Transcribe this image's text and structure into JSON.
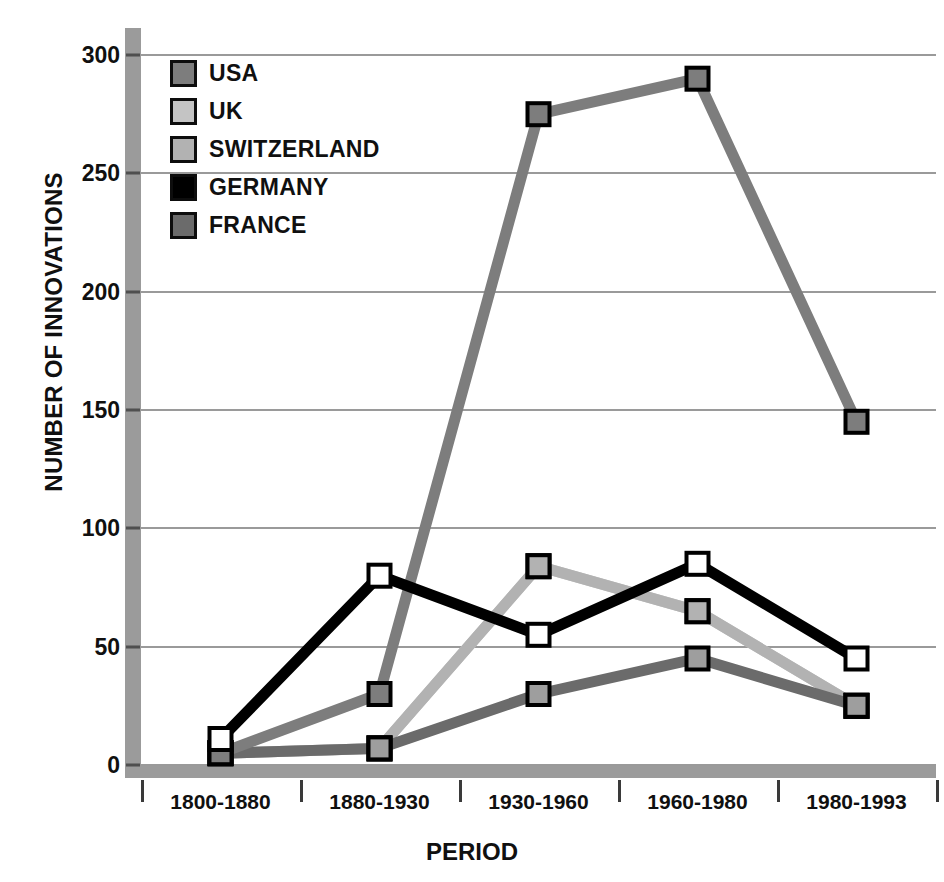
{
  "chart_data": {
    "type": "line",
    "title": "",
    "xlabel": "PERIOD",
    "ylabel": "NUMBER OF INNOVATIONS",
    "categories": [
      "1800-1880",
      "1880-1930",
      "1930-1960",
      "1960-1980",
      "1980-1993"
    ],
    "yticks": [
      0,
      50,
      100,
      150,
      200,
      250,
      300
    ],
    "ylim": [
      0,
      300
    ],
    "grid": true,
    "legend_position": "top-left inside plot",
    "series": [
      {
        "name": "USA",
        "color": "#7d7d7d",
        "marker_fill": "#7d7d7d",
        "values": [
          5,
          30,
          275,
          290,
          145
        ]
      },
      {
        "name": "UK",
        "color": "#c4c4c4",
        "marker_fill": "#c4c4c4",
        "values": [
          5,
          7,
          84,
          65,
          25
        ]
      },
      {
        "name": "SWITZERLAND",
        "color": "#b2b2b2",
        "marker_fill": "#b2b2b2",
        "values": [
          5,
          7,
          84,
          65,
          25
        ]
      },
      {
        "name": "GERMANY",
        "color": "#000000",
        "marker_fill": "#ffffff",
        "values": [
          11,
          80,
          55,
          85,
          45
        ]
      },
      {
        "name": "FRANCE",
        "color": "#6b6b6b",
        "marker_fill": "#9e9e9e",
        "values": [
          5,
          7,
          30,
          45,
          25
        ]
      }
    ]
  },
  "axes": {
    "y_title": "NUMBER OF INNOVATIONS",
    "x_title": "PERIOD",
    "y_tick_labels": [
      "300",
      "250",
      "200",
      "150",
      "100",
      "50",
      "0"
    ],
    "x_tick_labels": [
      "1800-1880",
      "1880-1930",
      "1930-1960",
      "1960-1980",
      "1980-1993"
    ]
  },
  "legend": {
    "items": [
      {
        "label": "USA",
        "swatch_color": "#7d7d7d"
      },
      {
        "label": "UK",
        "swatch_color": "#c4c4c4"
      },
      {
        "label": "SWITZERLAND",
        "swatch_color": "#b2b2b2"
      },
      {
        "label": "GERMANY",
        "swatch_color": "#000000"
      },
      {
        "label": "FRANCE",
        "swatch_color": "#6b6b6b"
      }
    ]
  },
  "style": {
    "axis_bar_color": "#9b9b9b",
    "grid_color": "#9a9a9a",
    "text_color": "#101010",
    "background": "#ffffff"
  }
}
